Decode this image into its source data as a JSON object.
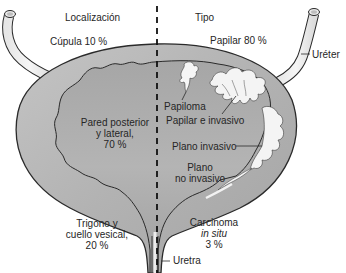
{
  "diagram": {
    "headers": {
      "left": "Localización",
      "right": "Tipo"
    },
    "location": {
      "dome": "Cúpula 10 %",
      "wall_line1": "Pared posterior",
      "wall_line2": "y lateral,",
      "wall_line3": "70 %",
      "trigone_line1": "Trigono y",
      "trigone_line2": "cuello vesical,",
      "trigone_line3": "20 %"
    },
    "type": {
      "papillary": "Papilar 80 %",
      "papilloma": "Papiloma",
      "papillary_invasive": "Papilar e invasivo",
      "flat_invasive": "Plano invasivo",
      "flat_noninvasive_line1": "Plano",
      "flat_noninvasive_line2": "no invasivo",
      "cis_line1": "Carcinoma",
      "cis_line2": "in situ",
      "cis_line3": "3 %"
    },
    "anatomy": {
      "ureter": "Uréter",
      "urethra": "Uretra"
    },
    "colors": {
      "bladder_wall": "#b4b4b4",
      "bladder_lumen": "#a8a8a8",
      "outline": "#2a2a2a",
      "tumor": "#f4f4f4"
    }
  }
}
